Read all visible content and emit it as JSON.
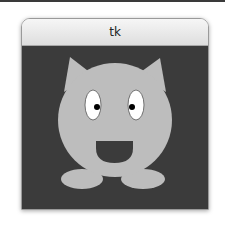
{
  "window": {
    "title": "tk"
  },
  "canvas": {
    "background": "#3b3b3b",
    "creature": {
      "body_color": "#bdbdbd",
      "eye_color": "#ffffff",
      "pupil_color": "#000000",
      "mouth_color": "#3b3b3b"
    }
  },
  "icons": {
    "creature": "cat-creature-drawing"
  }
}
